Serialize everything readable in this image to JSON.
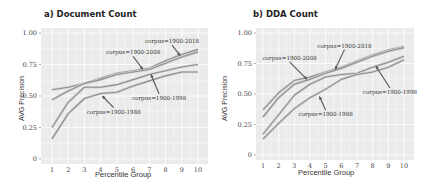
{
  "chart_data": [
    {
      "type": "line",
      "title": "a) Document Count",
      "xlabel": "Percentile Group",
      "ylabel": "AVG Precision",
      "x": [
        1,
        2,
        3,
        4,
        5,
        6,
        7,
        8,
        9,
        10
      ],
      "ylim": [
        0,
        1.0
      ],
      "yticks": [
        "0",
        "0.25",
        "0.50",
        "0.75",
        "1.00"
      ],
      "xticks": [
        "1",
        "2",
        "3",
        "4",
        "5",
        "6",
        "7",
        "8",
        "9",
        "10"
      ],
      "grid": true,
      "legend": "inline annotations with arrows",
      "series": [
        {
          "name": "corpus=1900-2018",
          "values": [
            0.55,
            0.57,
            0.6,
            0.64,
            0.68,
            0.7,
            0.72,
            0.78,
            0.83,
            0.87
          ]
        },
        {
          "name": "corpus=1900-2008",
          "values": [
            0.47,
            0.54,
            0.6,
            0.63,
            0.67,
            0.69,
            0.71,
            0.76,
            0.81,
            0.85
          ]
        },
        {
          "name": "corpus=1900-1998",
          "values": [
            0.25,
            0.45,
            0.57,
            0.57,
            0.59,
            0.63,
            0.67,
            0.7,
            0.73,
            0.75
          ]
        },
        {
          "name": "corpus=1900-1988",
          "values": [
            0.16,
            0.36,
            0.48,
            0.52,
            0.53,
            0.58,
            0.62,
            0.66,
            0.69,
            0.69
          ]
        }
      ],
      "annotations": [
        {
          "text": "corpus=1900-2018",
          "label_xy": [
            8.4,
            0.92
          ],
          "arrow_to": [
            8.9,
            0.82
          ]
        },
        {
          "text": "corpus=1900-2008",
          "label_xy": [
            6.0,
            0.83
          ],
          "arrow_to": [
            6.6,
            0.71
          ]
        },
        {
          "text": "corpus=1900-1998",
          "label_xy": [
            7.6,
            0.47
          ],
          "arrow_to": [
            7.1,
            0.67
          ]
        },
        {
          "text": "corpus=1900-1988",
          "label_xy": [
            4.8,
            0.36
          ],
          "arrow_to": [
            4.1,
            0.5
          ]
        }
      ]
    },
    {
      "type": "line",
      "title": "b) DDA Count",
      "xlabel": "Percentile Group",
      "ylabel": "AVG Precision",
      "x": [
        1,
        2,
        3,
        4,
        5,
        6,
        7,
        8,
        9,
        10
      ],
      "ylim": [
        0,
        1.0
      ],
      "yticks": [
        "0",
        "0.25",
        "0.50",
        "0.75",
        "1.00"
      ],
      "xticks": [
        "1",
        "2",
        "3",
        "4",
        "5",
        "6",
        "7",
        "8",
        "9",
        "10"
      ],
      "grid": true,
      "legend": "inline annotations with arrows",
      "series": [
        {
          "name": "corpus=1900-2018",
          "values": [
            0.37,
            0.51,
            0.61,
            0.64,
            0.68,
            0.72,
            0.77,
            0.82,
            0.86,
            0.89
          ]
        },
        {
          "name": "corpus=1900-2008",
          "values": [
            0.31,
            0.47,
            0.58,
            0.62,
            0.67,
            0.71,
            0.76,
            0.81,
            0.85,
            0.88
          ]
        },
        {
          "name": "corpus=1900-1998",
          "values": [
            0.17,
            0.33,
            0.49,
            0.58,
            0.64,
            0.66,
            0.67,
            0.72,
            0.76,
            0.81
          ]
        },
        {
          "name": "corpus=1900-1988",
          "values": [
            0.13,
            0.26,
            0.38,
            0.47,
            0.54,
            0.62,
            0.66,
            0.68,
            0.72,
            0.78
          ]
        }
      ],
      "annotations": [
        {
          "text": "corpus=1900-2018",
          "label_xy": [
            6.2,
            0.88
          ],
          "arrow_to": [
            5.6,
            0.7
          ]
        },
        {
          "text": "corpus=1900-2008",
          "label_xy": [
            2.7,
            0.78
          ],
          "arrow_to": [
            3.8,
            0.62
          ]
        },
        {
          "text": "corpus=1900-1998",
          "label_xy": [
            9.1,
            0.5
          ],
          "arrow_to": [
            8.2,
            0.73
          ]
        },
        {
          "text": "corpus=1900-1988",
          "label_xy": [
            5.0,
            0.32
          ],
          "arrow_to": [
            4.6,
            0.48
          ]
        }
      ]
    }
  ],
  "colors": {
    "panel_bg": "#ebebeb",
    "grid": "#ffffff",
    "line": "#8c8c8c",
    "line_halo": "#d4d4d4",
    "arrow": "#555555",
    "text": "#333333"
  }
}
